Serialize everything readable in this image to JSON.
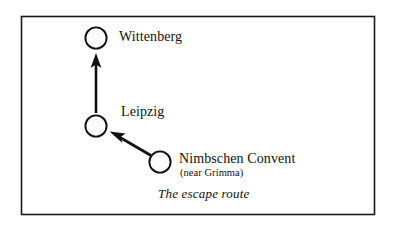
{
  "figure": {
    "caption": "The escape route",
    "border_color": "#1a1a1a",
    "background_color": "#ffffff",
    "ink_color": "#111111"
  },
  "nodes": [
    {
      "id": "wittenberg",
      "label": "Wittenberg",
      "sublabel": "",
      "cx": 96,
      "cy": 38,
      "r": 11
    },
    {
      "id": "leipzig",
      "label": "Leipzig",
      "sublabel": "",
      "cx": 96,
      "cy": 126,
      "r": 11
    },
    {
      "id": "nimbschen",
      "label": "Nimbschen Convent",
      "sublabel": "(near Grimma)",
      "cx": 160,
      "cy": 162,
      "r": 11
    }
  ],
  "arrows": [
    {
      "id": "nimbschen-to-leipzig",
      "from": "nimbschen",
      "to": "leipzig",
      "x1": 151,
      "y1": 155,
      "x2": 110,
      "y2": 131
    },
    {
      "id": "leipzig-to-wittenberg",
      "from": "leipzig",
      "to": "wittenberg",
      "x1": 96,
      "y1": 113,
      "x2": 96,
      "y2": 54
    }
  ]
}
